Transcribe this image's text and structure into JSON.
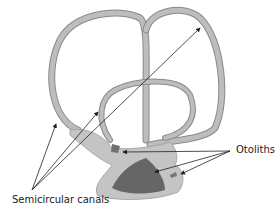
{
  "labels": {
    "semicircular": "Semicircular canals",
    "otoliths": "Otoliths"
  },
  "colors": {
    "canal_fill": "#b9b9b9",
    "canal_edge": "#8a8a8a",
    "base_fill": "#c4c4c4",
    "otolith_fill": "#666666",
    "arrow": "#222222"
  }
}
